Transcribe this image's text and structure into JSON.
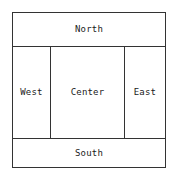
{
  "diagram": {
    "name": "border-layout-diagram",
    "colors": {
      "background": "#ffffff",
      "line": "#333333",
      "text": "#1a1a1a"
    },
    "regions": [
      {
        "id": "north",
        "label": "North"
      },
      {
        "id": "west",
        "label": "West"
      },
      {
        "id": "center",
        "label": "Center"
      },
      {
        "id": "east",
        "label": "East"
      },
      {
        "id": "south",
        "label": "South"
      }
    ]
  }
}
